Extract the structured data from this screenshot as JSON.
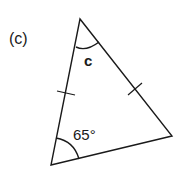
{
  "diagram": {
    "part_label": "(c)",
    "type": "isosceles-triangle",
    "vertices": {
      "top": [
        80,
        19
      ],
      "bottom_left": [
        51,
        165
      ],
      "right": [
        172,
        136
      ]
    },
    "angles": {
      "top": {
        "label": "c",
        "unknown": true
      },
      "bottom_left": {
        "label": "65°",
        "value": 65
      }
    },
    "equal_sides": [
      "top-to-bottom_left",
      "top-to-right"
    ],
    "tick_marks": 2,
    "colors": {
      "stroke": "#1a1a1a",
      "background": "#ffffff"
    }
  }
}
